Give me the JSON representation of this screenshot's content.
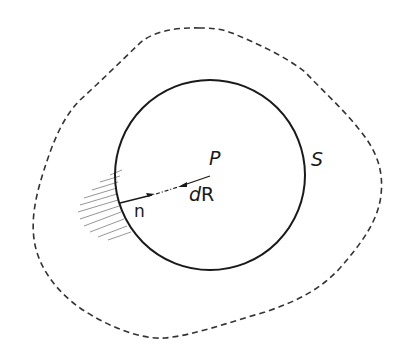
{
  "figure": {
    "labels": {
      "point": "P",
      "surface": "S",
      "normal": "n",
      "element_d": "d",
      "element_R": "R"
    },
    "colors": {
      "ink": "#1a1a1a",
      "dashed": "#333333",
      "hatch": "#8a8a8a",
      "background": "#ffffff"
    },
    "shapes": {
      "inner_circle": {
        "cx": 210,
        "cy": 175,
        "r": 95,
        "style": "solid"
      },
      "outer_boundary": {
        "style": "dashed"
      },
      "hatched_region": {
        "side": "left of circle, outside"
      },
      "normal_arrow": {
        "direction": "inward from surface toward P"
      },
      "dR_arrow": {
        "direction": "toward surface"
      }
    }
  }
}
